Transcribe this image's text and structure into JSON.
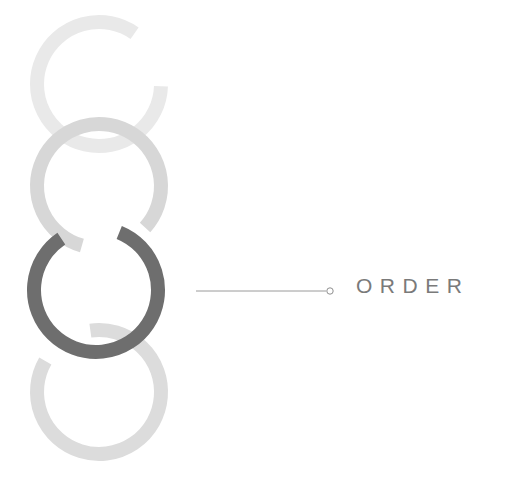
{
  "canvas": {
    "width": 515,
    "height": 480,
    "background": "#ffffff"
  },
  "diagram": {
    "type": "linked-rings-callout",
    "title_label": "ORDER",
    "active_step_index": 2,
    "ring_count": 4
  },
  "rings": [
    {
      "name": "ring-1",
      "cx": 99,
      "cy": 84,
      "r": 62,
      "stroke_width": 14,
      "color": "#e9e9e9",
      "gap_start_deg": 35,
      "gap_end_deg": 92,
      "state": "inactive"
    },
    {
      "name": "ring-2",
      "cx": 99,
      "cy": 186,
      "r": 62,
      "stroke_width": 14,
      "color": "#d7d7d7",
      "gap_start_deg": 132,
      "gap_end_deg": 196,
      "state": "inactive"
    },
    {
      "name": "ring-3",
      "cx": 96,
      "cy": 290,
      "r": 62,
      "stroke_width": 14,
      "color": "#6e6e6e",
      "gap_start_deg": 326,
      "gap_end_deg": 22,
      "state": "active"
    },
    {
      "name": "ring-4",
      "cx": 99,
      "cy": 392,
      "r": 62,
      "stroke_width": 14,
      "color": "#dcdcdc",
      "gap_start_deg": 300,
      "gap_end_deg": 352,
      "state": "inactive"
    }
  ],
  "callout": {
    "line_x1": 196,
    "line_x2": 326,
    "line_y": 291,
    "line_color": "#9a9a9a",
    "line_width": 1,
    "dot_cx": 330,
    "dot_cy": 291,
    "dot_r": 3.2,
    "dot_stroke": "#8f8f8f",
    "dot_fill": "#ffffff",
    "label": "ORDER",
    "label_color": "#7a7a7a"
  }
}
